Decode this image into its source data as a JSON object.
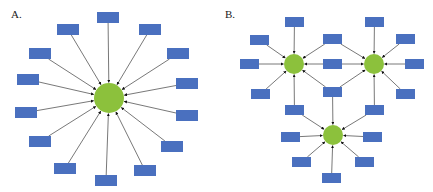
{
  "figure": {
    "width": 433,
    "height": 192,
    "colors": {
      "box": "#4a70bf",
      "hub": "#8cc13c",
      "edge": "#555555",
      "background": "#ffffff"
    },
    "box_size": {
      "A": [
        22,
        11
      ],
      "B": [
        19,
        10
      ]
    }
  },
  "panels": [
    {
      "id": "A",
      "label": "A.",
      "label_pos": [
        11,
        9
      ],
      "description": "Single central hub with 14 peripheral nodes, all pointing to the hub",
      "hubs": [
        {
          "id": "A-hub",
          "cx": 109,
          "cy": 98,
          "r": 15
        }
      ],
      "boxes": [
        {
          "id": "A1",
          "x": 97,
          "y": 12,
          "to": [
            "A-hub"
          ]
        },
        {
          "id": "A2",
          "x": 57,
          "y": 24,
          "to": [
            "A-hub"
          ]
        },
        {
          "id": "A3",
          "x": 139,
          "y": 24,
          "to": [
            "A-hub"
          ]
        },
        {
          "id": "A4",
          "x": 29,
          "y": 48,
          "to": [
            "A-hub"
          ]
        },
        {
          "id": "A5",
          "x": 167,
          "y": 48,
          "to": [
            "A-hub"
          ]
        },
        {
          "id": "A6",
          "x": 17,
          "y": 74,
          "to": [
            "A-hub"
          ]
        },
        {
          "id": "A7",
          "x": 176,
          "y": 78,
          "to": [
            "A-hub"
          ]
        },
        {
          "id": "A8",
          "x": 15,
          "y": 107,
          "to": [
            "A-hub"
          ]
        },
        {
          "id": "A9",
          "x": 176,
          "y": 110,
          "to": [
            "A-hub"
          ]
        },
        {
          "id": "A10",
          "x": 29,
          "y": 136,
          "to": [
            "A-hub"
          ]
        },
        {
          "id": "A11",
          "x": 161,
          "y": 141,
          "to": [
            "A-hub"
          ]
        },
        {
          "id": "A12",
          "x": 54,
          "y": 163,
          "to": [
            "A-hub"
          ]
        },
        {
          "id": "A13",
          "x": 134,
          "y": 165,
          "to": [
            "A-hub"
          ]
        },
        {
          "id": "A14",
          "x": 95,
          "y": 175,
          "to": [
            "A-hub"
          ]
        }
      ]
    },
    {
      "id": "B",
      "label": "B.",
      "label_pos": [
        225,
        9
      ],
      "description": "Three interconnected hubs; shared nodes point to multiple hubs",
      "hubs": [
        {
          "id": "B-left",
          "cx": 294,
          "cy": 64,
          "r": 10
        },
        {
          "id": "B-right",
          "cx": 374,
          "cy": 64,
          "r": 10
        },
        {
          "id": "B-bottom",
          "cx": 333,
          "cy": 135,
          "r": 10
        }
      ],
      "boxes": [
        {
          "id": "B1",
          "x": 285,
          "y": 17,
          "to": [
            "B-left"
          ]
        },
        {
          "id": "B2",
          "x": 250,
          "y": 35,
          "to": [
            "B-left"
          ]
        },
        {
          "id": "B3",
          "x": 240,
          "y": 59,
          "to": [
            "B-left"
          ]
        },
        {
          "id": "B4",
          "x": 251,
          "y": 89,
          "to": [
            "B-left"
          ]
        },
        {
          "id": "B5",
          "x": 323,
          "y": 34,
          "to": [
            "B-left",
            "B-right"
          ]
        },
        {
          "id": "B6",
          "x": 323,
          "y": 59,
          "to": [
            "B-left",
            "B-right"
          ]
        },
        {
          "id": "B7",
          "x": 323,
          "y": 87,
          "to": [
            "B-left",
            "B-right",
            "B-bottom"
          ]
        },
        {
          "id": "B8",
          "x": 285,
          "y": 105,
          "to": [
            "B-left",
            "B-bottom"
          ]
        },
        {
          "id": "B9",
          "x": 365,
          "y": 105,
          "to": [
            "B-right",
            "B-bottom"
          ]
        },
        {
          "id": "B10",
          "x": 365,
          "y": 17,
          "to": [
            "B-right"
          ]
        },
        {
          "id": "B11",
          "x": 396,
          "y": 34,
          "to": [
            "B-right"
          ]
        },
        {
          "id": "B12",
          "x": 405,
          "y": 59,
          "to": [
            "B-right"
          ]
        },
        {
          "id": "B13",
          "x": 396,
          "y": 89,
          "to": [
            "B-right"
          ]
        },
        {
          "id": "B14",
          "x": 281,
          "y": 132,
          "to": [
            "B-bottom"
          ]
        },
        {
          "id": "B15",
          "x": 363,
          "y": 132,
          "to": [
            "B-bottom"
          ]
        },
        {
          "id": "B16",
          "x": 292,
          "y": 157,
          "to": [
            "B-bottom"
          ]
        },
        {
          "id": "B17",
          "x": 355,
          "y": 157,
          "to": [
            "B-bottom"
          ]
        },
        {
          "id": "B18",
          "x": 322,
          "y": 173,
          "to": [
            "B-bottom"
          ]
        }
      ]
    }
  ]
}
